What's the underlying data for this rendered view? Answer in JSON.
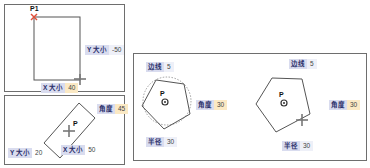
{
  "panels": {
    "rectangle": {
      "point_label": "P1",
      "y_size": {
        "label": "Y 大小",
        "value": "-50"
      },
      "x_size": {
        "label": "X 大小",
        "value": "40"
      }
    },
    "rotated_rectangle": {
      "point_label": "P",
      "angle": {
        "label": "角度",
        "value": "45"
      },
      "y_size": {
        "label": "Y 大小",
        "value": "20"
      },
      "x_size": {
        "label": "X 大小",
        "value": "50"
      }
    },
    "polygon_left": {
      "point_label": "P",
      "sides": {
        "label": "边线",
        "value": "5"
      },
      "angle": {
        "label": "角度",
        "value": "30"
      },
      "radius": {
        "label": "半径",
        "value": "30"
      }
    },
    "polygon_right": {
      "point_label": "P",
      "sides": {
        "label": "边线",
        "value": "5"
      },
      "angle": {
        "label": "角度",
        "value": "30"
      },
      "radius": {
        "label": "半径",
        "value": "30"
      }
    }
  },
  "colors": {
    "label_bg": "#d9dcef",
    "active_value_bg": "#fbe9c4",
    "start_point": "#e0503a",
    "outline": "#555555"
  }
}
